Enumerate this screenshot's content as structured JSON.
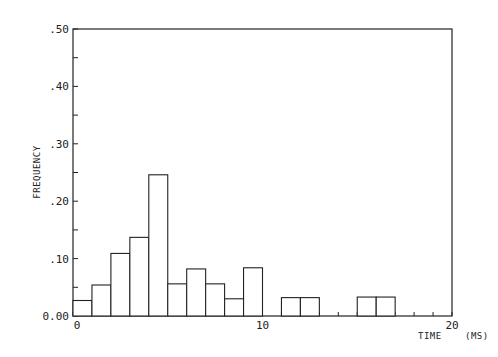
{
  "chart_data": {
    "type": "bar",
    "subtype": "histogram",
    "title": "",
    "xlabel": "TIME",
    "xunit": "(MS)",
    "ylabel": "FREQUENCY",
    "xlim": [
      0,
      20
    ],
    "ylim": [
      0,
      0.5
    ],
    "x_ticks": [
      0,
      10,
      20
    ],
    "x_tick_labels": [
      "0",
      "10",
      "20"
    ],
    "y_ticks": [
      0.0,
      0.1,
      0.2,
      0.3,
      0.4,
      0.5
    ],
    "y_tick_labels": [
      "0.00",
      ".10",
      ".20",
      ".30",
      ".40",
      ".50"
    ],
    "y_minor_tick_step": 0.05,
    "grid": false,
    "legend": null,
    "bin_width": 1,
    "bins": [
      {
        "start": 0,
        "end": 1,
        "value": 0.027
      },
      {
        "start": 1,
        "end": 2,
        "value": 0.054
      },
      {
        "start": 2,
        "end": 3,
        "value": 0.109
      },
      {
        "start": 3,
        "end": 4,
        "value": 0.137
      },
      {
        "start": 4,
        "end": 5,
        "value": 0.246
      },
      {
        "start": 5,
        "end": 6,
        "value": 0.056
      },
      {
        "start": 6,
        "end": 7,
        "value": 0.082
      },
      {
        "start": 7,
        "end": 8,
        "value": 0.056
      },
      {
        "start": 8,
        "end": 9,
        "value": 0.03
      },
      {
        "start": 9,
        "end": 10,
        "value": 0.084
      },
      {
        "start": 10,
        "end": 11,
        "value": 0.0
      },
      {
        "start": 11,
        "end": 12,
        "value": 0.032
      },
      {
        "start": 12,
        "end": 13,
        "value": 0.032
      },
      {
        "start": 13,
        "end": 14,
        "value": 0.0
      },
      {
        "start": 14,
        "end": 15,
        "value": 0.0
      },
      {
        "start": 15,
        "end": 16,
        "value": 0.033
      },
      {
        "start": 16,
        "end": 17,
        "value": 0.033
      },
      {
        "start": 17,
        "end": 18,
        "value": 0.0
      },
      {
        "start": 18,
        "end": 19,
        "value": 0.0
      },
      {
        "start": 19,
        "end": 20,
        "value": 0.0
      }
    ],
    "categories": [
      "0-1",
      "1-2",
      "2-3",
      "3-4",
      "4-5",
      "5-6",
      "6-7",
      "7-8",
      "8-9",
      "9-10",
      "10-11",
      "11-12",
      "12-13",
      "13-14",
      "14-15",
      "15-16",
      "16-17",
      "17-18",
      "18-19",
      "19-20"
    ],
    "values": [
      0.027,
      0.054,
      0.109,
      0.137,
      0.246,
      0.056,
      0.082,
      0.056,
      0.03,
      0.084,
      0.0,
      0.032,
      0.032,
      0.0,
      0.0,
      0.033,
      0.033,
      0.0,
      0.0,
      0.0
    ]
  },
  "colors": {
    "ink": "#222222",
    "background": "#ffffff",
    "bar_fill": "#ffffff"
  }
}
